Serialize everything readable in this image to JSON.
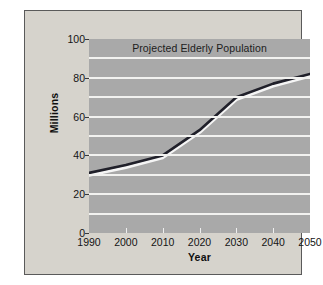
{
  "figure": {
    "title": "Projected Elderly Population",
    "x_axis_title": "Year",
    "y_axis_title": "Millions",
    "panel_background": "#d6d3cc",
    "plot_background": "#a9a9a9",
    "gridline_color": "#f2f2f0",
    "line_color": "#20202a",
    "line_highlight_color": "#f5f5f5",
    "border_color": "#5a5a5a"
  },
  "chart_data": {
    "type": "line",
    "title": "Projected Elderly Population",
    "xlabel": "Year",
    "ylabel": "Millions",
    "x": [
      1990,
      2000,
      2010,
      2020,
      2030,
      2040,
      2050
    ],
    "values": [
      31,
      35,
      40,
      53,
      70,
      77,
      82
    ],
    "series": [
      {
        "name": "Projected Elderly Population",
        "values": [
          31,
          35,
          40,
          53,
          70,
          77,
          82
        ]
      }
    ],
    "xlim": [
      1990,
      2050
    ],
    "ylim": [
      0,
      100
    ],
    "xticks": [
      1990,
      2000,
      2010,
      2020,
      2030,
      2040,
      2050
    ],
    "xtick_labels": [
      "1990",
      "2000",
      "2010",
      "2020",
      "2030",
      "2040",
      "2050"
    ],
    "yticks": [
      0,
      20,
      40,
      60,
      80,
      100
    ],
    "ytick_labels": [
      "0",
      "20",
      "40",
      "60",
      "80",
      "100"
    ],
    "gridlines_y": [
      0,
      10,
      20,
      30,
      40,
      50,
      60,
      70,
      80,
      90,
      100
    ],
    "grid": "horizontal",
    "legend": "none",
    "units": "millions of people"
  }
}
